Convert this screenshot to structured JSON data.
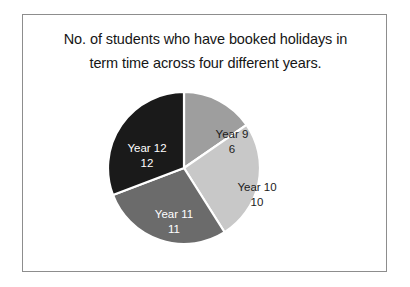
{
  "figure": {
    "title_line1": "No. of students who have booked holidays in",
    "title_line2": "term time across four different years.",
    "border_color": "#8d8d8d",
    "background_color": "#ffffff"
  },
  "chart_data": {
    "type": "pie",
    "title": "No. of students who have booked holidays in term time across four different years.",
    "xlabel": "",
    "ylabel": "",
    "total": 39,
    "start_angle_deg": 0,
    "direction": "clockwise",
    "legend": "none",
    "grid": false,
    "categories": [
      "Year 9",
      "Year 10",
      "Year 11",
      "Year 12"
    ],
    "values": [
      6,
      10,
      11,
      12
    ],
    "colors": [
      "#9e9e9e",
      "#c8c8c8",
      "#6b6b6b",
      "#1a1a1a"
    ],
    "slices": [
      {
        "label": "Year 9",
        "value": 6,
        "value_text": "6",
        "color": "#9e9e9e",
        "text_color": "#1b1b1b",
        "percent": 15.4,
        "start_deg": 0,
        "end_deg": 55.4
      },
      {
        "label": "Year 10",
        "value": 10,
        "value_text": "10",
        "color": "#c8c8c8",
        "text_color": "#1b1b1b",
        "percent": 25.6,
        "start_deg": 55.4,
        "end_deg": 147.7
      },
      {
        "label": "Year 11",
        "value": 11,
        "value_text": "11",
        "color": "#6b6b6b",
        "text_color": "#ffffff",
        "percent": 28.2,
        "start_deg": 147.7,
        "end_deg": 249.2
      },
      {
        "label": "Year 12",
        "value": 12,
        "value_text": "12",
        "color": "#1a1a1a",
        "text_color": "#ffffff",
        "percent": 30.8,
        "start_deg": 249.2,
        "end_deg": 360
      }
    ]
  }
}
